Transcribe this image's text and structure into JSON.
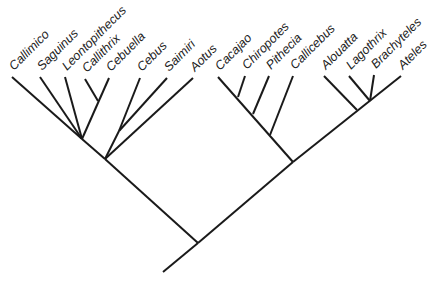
{
  "diagram": {
    "type": "cladogram",
    "line_color": "#1a1a1a",
    "taxa": [
      {
        "id": "callimico",
        "label": "Callimico",
        "tip": [
          12,
          77
        ]
      },
      {
        "id": "saguinus",
        "label": "Saguinus",
        "tip": [
          40,
          77
        ]
      },
      {
        "id": "leontopithecus",
        "label": "Leontopithecus",
        "tip": [
          65,
          77
        ]
      },
      {
        "id": "callithrix",
        "label": "Callithrix",
        "tip": [
          85,
          79
        ]
      },
      {
        "id": "cebuella",
        "label": "Cebuella",
        "tip": [
          109,
          78
        ]
      },
      {
        "id": "cebus",
        "label": "Cebus",
        "tip": [
          140,
          78
        ]
      },
      {
        "id": "saimiri",
        "label": "Saimiri",
        "tip": [
          167,
          78
        ]
      },
      {
        "id": "aotus",
        "label": "Aotus",
        "tip": [
          193,
          78
        ]
      },
      {
        "id": "cacajao",
        "label": "Cacajao",
        "tip": [
          218,
          77
        ]
      },
      {
        "id": "chiropotes",
        "label": "Chiropotes",
        "tip": [
          245,
          76
        ]
      },
      {
        "id": "pithecia",
        "label": "Pithecia",
        "tip": [
          269,
          76
        ]
      },
      {
        "id": "callicebus",
        "label": "Callicebus",
        "tip": [
          293,
          76
        ]
      },
      {
        "id": "alouatta",
        "label": "Alouatta",
        "tip": [
          324,
          76
        ]
      },
      {
        "id": "lagothrix",
        "label": "Lagothrix",
        "tip": [
          349,
          76
        ]
      },
      {
        "id": "brachyteles",
        "label": "Brachyteles",
        "tip": [
          374,
          75
        ]
      },
      {
        "id": "ateles",
        "label": "Ateles",
        "tip": [
          401,
          76
        ]
      }
    ],
    "branches": [
      {
        "from": [
          163,
          272
        ],
        "to": [
          198,
          243
        ]
      },
      {
        "from": [
          198,
          243
        ],
        "to": [
          105,
          159
        ]
      },
      {
        "from": [
          198,
          243
        ],
        "to": [
          293,
          162
        ]
      },
      {
        "from": [
          105,
          159
        ],
        "to": [
          82,
          139
        ]
      },
      {
        "from": [
          82,
          139
        ],
        "to": [
          12,
          77
        ]
      },
      {
        "from": [
          82,
          139
        ],
        "to": [
          40,
          77
        ]
      },
      {
        "from": [
          82,
          139
        ],
        "to": [
          65,
          77
        ]
      },
      {
        "from": [
          82,
          139
        ],
        "to": [
          109,
          78
        ]
      },
      {
        "from": [
          98,
          101
        ],
        "to": [
          85,
          79
        ]
      },
      {
        "from": [
          105,
          159
        ],
        "to": [
          193,
          78
        ]
      },
      {
        "from": [
          105,
          159
        ],
        "to": [
          119,
          131
        ]
      },
      {
        "from": [
          119,
          131
        ],
        "to": [
          140,
          78
        ]
      },
      {
        "from": [
          119,
          131
        ],
        "to": [
          167,
          78
        ]
      },
      {
        "from": [
          293,
          162
        ],
        "to": [
          218,
          77
        ]
      },
      {
        "from": [
          238,
          97
        ],
        "to": [
          245,
          76
        ]
      },
      {
        "from": [
          253,
          114
        ],
        "to": [
          269,
          76
        ]
      },
      {
        "from": [
          270,
          135
        ],
        "to": [
          293,
          76
        ]
      },
      {
        "from": [
          293,
          162
        ],
        "to": [
          401,
          76
        ]
      },
      {
        "from": [
          357,
          110
        ],
        "to": [
          324,
          76
        ]
      },
      {
        "from": [
          370,
          101
        ],
        "to": [
          349,
          76
        ]
      },
      {
        "from": [
          370,
          101
        ],
        "to": [
          374,
          75
        ]
      }
    ]
  }
}
